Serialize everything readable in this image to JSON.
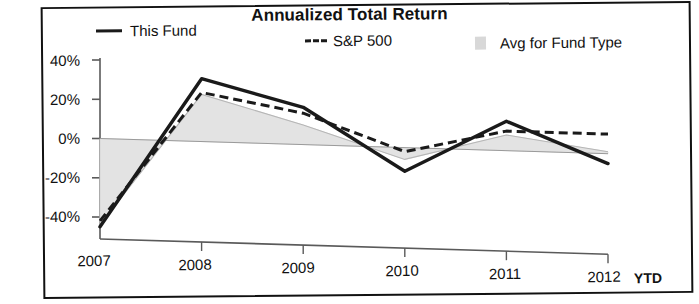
{
  "chart_data": {
    "type": "line",
    "title": "Annualized Total Return",
    "xlabel": "",
    "ylabel": "",
    "categories": [
      "2007",
      "2008",
      "2009",
      "2010",
      "2011",
      "2012 YTD"
    ],
    "ylim": [
      -50,
      40
    ],
    "yticks": [
      40,
      20,
      0,
      -20,
      -40
    ],
    "ytick_labels": [
      "40%",
      "20%",
      "0%",
      "-20%",
      "-40%"
    ],
    "grid": false,
    "legend_position": "top",
    "series": [
      {
        "name": "This Fund",
        "style": "solid",
        "values": [
          -45,
          32,
          19,
          -12,
          15,
          -5
        ]
      },
      {
        "name": "S&P 500",
        "style": "dashed",
        "values": [
          -42,
          25,
          16,
          -2,
          10,
          10
        ]
      },
      {
        "name": "Avg for Fund Type",
        "style": "area",
        "values": [
          -44,
          24,
          10,
          -6,
          8,
          1
        ]
      }
    ]
  },
  "legend": {
    "this_fund": "This Fund",
    "sp500": "S&P 500",
    "avg_fund_type": "Avg for Fund Type"
  },
  "axis": {
    "y_ticks": [
      "40%",
      "20%",
      "0%",
      "-20%",
      "-40%"
    ],
    "x_ticks": [
      "2007",
      "2008",
      "2009",
      "2010",
      "2011",
      "2012"
    ],
    "ytd_tag": "YTD"
  },
  "colors": {
    "this_fund_line": "#1a1a1a",
    "sp500_line": "#1a1a1a",
    "avg_area_fill": "#e2e2e2",
    "axis": "#5a5a5a",
    "frame": "#111111",
    "text": "#111111"
  }
}
